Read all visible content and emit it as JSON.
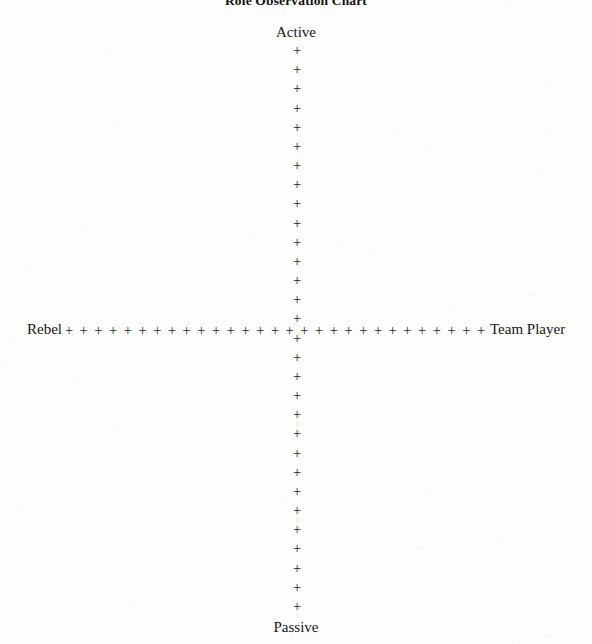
{
  "document": {
    "title": "Role Observation Chart",
    "background_color": "#fdfdfc",
    "ink_color": "#262626"
  },
  "chart_data": {
    "type": "scatter",
    "title": "Role Observation Chart",
    "subtitle": "",
    "xlabel": "",
    "ylabel": "",
    "grid": false,
    "legend": null,
    "axes": [
      {
        "name": "vertical-axis",
        "orientation": "vertical",
        "positive_end_label": "Active",
        "negative_end_label": "Passive",
        "marker": "+",
        "marker_count": 30,
        "center_px": {
          "x": 297,
          "y": 330
        },
        "start_px": {
          "x": 297,
          "y": 50
        },
        "end_px": {
          "x": 297,
          "y": 606
        },
        "spacing_px": 19.2
      },
      {
        "name": "horizontal-axis",
        "orientation": "horizontal",
        "negative_end_label": "Rebel",
        "positive_end_label": "Team Player",
        "marker": "+",
        "marker_count": 29,
        "center_px": {
          "x": 297,
          "y": 330
        },
        "start_px": {
          "x": 69,
          "y": 330
        },
        "end_px": {
          "x": 481,
          "y": 330
        },
        "spacing_px": 14.7
      }
    ],
    "quadrants": [
      {
        "name": "active-rebel",
        "x_pole": "Rebel",
        "y_pole": "Active"
      },
      {
        "name": "active-team-player",
        "x_pole": "Team Player",
        "y_pole": "Active"
      },
      {
        "name": "passive-rebel",
        "x_pole": "Rebel",
        "y_pole": "Passive"
      },
      {
        "name": "passive-team-player",
        "x_pole": "Team Player",
        "y_pole": "Passive"
      }
    ],
    "series": [
      {
        "name": "observations",
        "x": [],
        "y": []
      }
    ],
    "values": [],
    "categories": []
  },
  "labels": {
    "top": "Active",
    "bottom": "Passive",
    "left": "Rebel",
    "right": "Team Player"
  },
  "marker": {
    "glyph": "+"
  }
}
